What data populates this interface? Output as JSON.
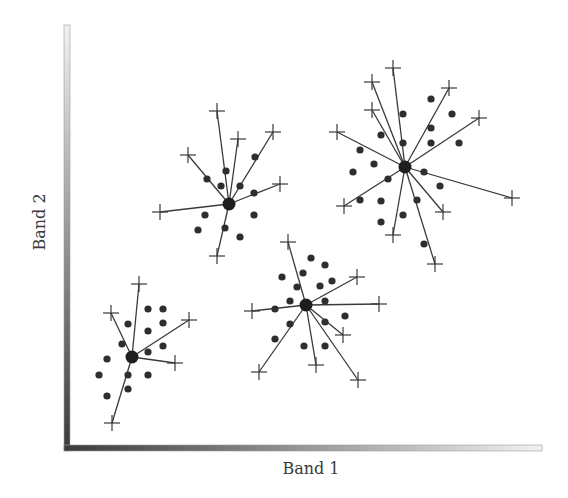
{
  "diagram": {
    "type": "cluster-scatter",
    "x_axis_label": "Band 1",
    "y_axis_label": "Band 2",
    "colors": {
      "point": "#2e2e2e",
      "line": "#3a3a3a",
      "center": "#1e1e1e",
      "axis_dark": "#3a3a3a",
      "axis_light": "#f2f2f2",
      "label": "#3a3a3a"
    },
    "axes": {
      "y": {
        "x": 64,
        "top": 25,
        "bottom": 451,
        "width": 6
      },
      "x": {
        "y": 445,
        "left": 64,
        "right": 542,
        "height": 6
      }
    },
    "clusters": [
      {
        "id": "cluster-1",
        "center": [
          132,
          357
        ],
        "outliers": [
          [
            139,
            284
          ],
          [
            111,
            313
          ],
          [
            189,
            320
          ],
          [
            175,
            363
          ],
          [
            112,
            423
          ]
        ],
        "points": [
          [
            148,
            309
          ],
          [
            163,
            309
          ],
          [
            128,
            324
          ],
          [
            163,
            323
          ],
          [
            148,
            331
          ],
          [
            122,
            344
          ],
          [
            163,
            346
          ],
          [
            148,
            352
          ],
          [
            107,
            359
          ],
          [
            99,
            375
          ],
          [
            128,
            375
          ],
          [
            148,
            375
          ],
          [
            128,
            389
          ],
          [
            107,
            396
          ]
        ]
      },
      {
        "id": "cluster-2",
        "center": [
          229,
          204
        ],
        "outliers": [
          [
            217,
            111
          ],
          [
            238,
            139
          ],
          [
            273,
            132
          ],
          [
            188,
            155
          ],
          [
            280,
            184
          ],
          [
            160,
            212
          ],
          [
            217,
            256
          ]
        ],
        "points": [
          [
            255,
            157
          ],
          [
            226,
            171
          ],
          [
            207,
            179
          ],
          [
            221,
            186
          ],
          [
            240,
            186
          ],
          [
            254,
            193
          ],
          [
            205,
            215
          ],
          [
            254,
            215
          ],
          [
            198,
            230
          ],
          [
            225,
            228
          ],
          [
            240,
            237
          ]
        ]
      },
      {
        "id": "cluster-3",
        "center": [
          405,
          167
        ],
        "outliers": [
          [
            393,
            68
          ],
          [
            372,
            82
          ],
          [
            449,
            88
          ],
          [
            372,
            110
          ],
          [
            479,
            118
          ],
          [
            337,
            132
          ],
          [
            512,
            198
          ],
          [
            344,
            206
          ],
          [
            443,
            212
          ],
          [
            393,
            235
          ],
          [
            435,
            264
          ]
        ],
        "points": [
          [
            431,
            99
          ],
          [
            403,
            114
          ],
          [
            452,
            114
          ],
          [
            431,
            128
          ],
          [
            381,
            135
          ],
          [
            403,
            143
          ],
          [
            431,
            143
          ],
          [
            459,
            143
          ],
          [
            360,
            150
          ],
          [
            374,
            164
          ],
          [
            353,
            172
          ],
          [
            424,
            172
          ],
          [
            388,
            179
          ],
          [
            440,
            186
          ],
          [
            360,
            200
          ],
          [
            381,
            201
          ],
          [
            417,
            200
          ],
          [
            403,
            215
          ],
          [
            381,
            222
          ],
          [
            424,
            244
          ]
        ]
      },
      {
        "id": "cluster-4",
        "center": [
          306,
          305
        ],
        "outliers": [
          [
            288,
            242
          ],
          [
            357,
            277
          ],
          [
            252,
            311
          ],
          [
            379,
            304
          ],
          [
            343,
            335
          ],
          [
            316,
            365
          ],
          [
            259,
            372
          ],
          [
            358,
            380
          ]
        ],
        "points": [
          [
            311,
            258
          ],
          [
            325,
            265
          ],
          [
            282,
            277
          ],
          [
            303,
            273
          ],
          [
            332,
            281
          ],
          [
            297,
            287
          ],
          [
            320,
            286
          ],
          [
            290,
            301
          ],
          [
            325,
            301
          ],
          [
            275,
            309
          ],
          [
            345,
            316
          ],
          [
            290,
            324
          ],
          [
            325,
            322
          ],
          [
            275,
            339
          ],
          [
            304,
            346
          ],
          [
            325,
            346
          ]
        ]
      }
    ]
  }
}
